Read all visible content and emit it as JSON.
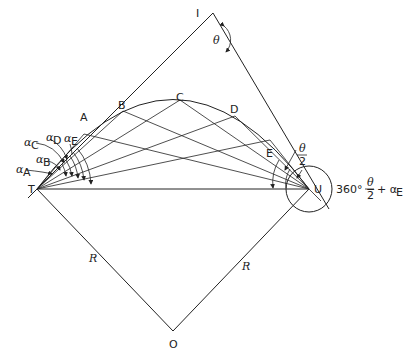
{
  "diagram": {
    "title": "",
    "points": {
      "I": {
        "label": "I",
        "x": 213,
        "y": 13
      },
      "T": {
        "label": "T",
        "x": 37,
        "y": 189
      },
      "U": {
        "label": "U",
        "x": 309,
        "y": 189
      },
      "O": {
        "label": "O",
        "x": 173,
        "y": 331
      },
      "A": {
        "label": "A",
        "x": 84,
        "y": 116
      },
      "B": {
        "label": "B",
        "x": 123,
        "y": 104
      },
      "C": {
        "label": "C",
        "x": 180,
        "y": 98
      },
      "D": {
        "label": "D",
        "x": 235,
        "y": 109
      },
      "E": {
        "label": "E",
        "x": 270,
        "y": 126
      }
    },
    "labels": {
      "theta": "θ",
      "theta_half_num": "θ",
      "theta_half_den": "2",
      "radius_left": "R",
      "radius_right": "R",
      "alpha_A": "α",
      "alpha_A_sub": "A",
      "alpha_B": "α",
      "alpha_B_sub": "B",
      "alpha_C": "α",
      "alpha_C_sub": "C",
      "alpha_D": "α",
      "alpha_D_sub": "D",
      "alpha_E": "α",
      "alpha_E_sub": "E",
      "formula_prefix": "360° −",
      "formula_num": "θ",
      "formula_den": "2",
      "formula_suffix": "+ α",
      "formula_sub": "E"
    }
  }
}
